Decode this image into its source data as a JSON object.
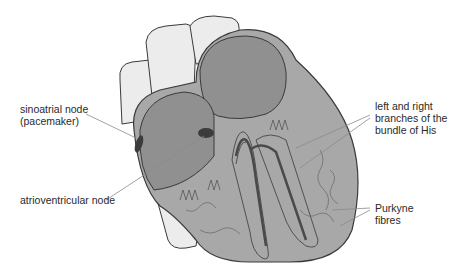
{
  "diagram": {
    "colors": {
      "muscle": "#a8a8a8",
      "chamber": "#909090",
      "vessel": "#e8e8e8",
      "outline": "#3a3a3a",
      "node": "#3c3c3c",
      "leader_line": "#8a8a8a",
      "text": "#2a2a2a"
    },
    "labels": [
      {
        "id": "sa-node",
        "lines": [
          "sinoatrial node",
          "(pacemaker)"
        ]
      },
      {
        "id": "av-node",
        "lines": [
          "atrioventricular node"
        ]
      },
      {
        "id": "bundle-of-his",
        "lines": [
          "left and right",
          "branches of the",
          "bundle of His"
        ]
      },
      {
        "id": "purkyne",
        "lines": [
          "Purkyne",
          "fibres"
        ]
      }
    ]
  }
}
